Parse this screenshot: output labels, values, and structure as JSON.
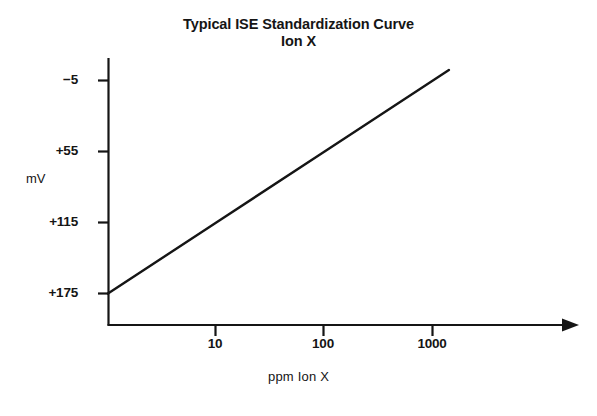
{
  "chart_data": {
    "type": "line",
    "title": "Typical ISE Standardization Curve",
    "subtitle": "Ion X",
    "xlabel": "ppm Ion X",
    "ylabel": "mV",
    "xscale": "log",
    "yscale": "linear",
    "grid": false,
    "legend": null,
    "x_ticks": [
      {
        "label": "10",
        "value": 10
      },
      {
        "label": "100",
        "value": 100
      },
      {
        "label": "1000",
        "value": 1000
      }
    ],
    "y_ticks": [
      {
        "label": "−5",
        "value": -5
      },
      {
        "label": "+55",
        "value": 55
      },
      {
        "label": "+115",
        "value": 115
      },
      {
        "label": "+175",
        "value": 175
      }
    ],
    "xlim": [
      1,
      30000
    ],
    "ylim": [
      205,
      -18
    ],
    "y_axis_inverted": true,
    "series": [
      {
        "name": "Ion X standardization curve",
        "points": [
          {
            "x": 1,
            "y": 175
          },
          {
            "x": 10,
            "y": 115
          },
          {
            "x": 100,
            "y": 55
          },
          {
            "x": 1000,
            "y": -5
          },
          {
            "x": 10000,
            "y": -65
          }
        ],
        "slope_mv_per_decade": -60,
        "color": "#151515"
      }
    ],
    "axis_arrow_x": true
  },
  "figure": {
    "background_color": "#ffffff",
    "ink_color": "#151515"
  }
}
